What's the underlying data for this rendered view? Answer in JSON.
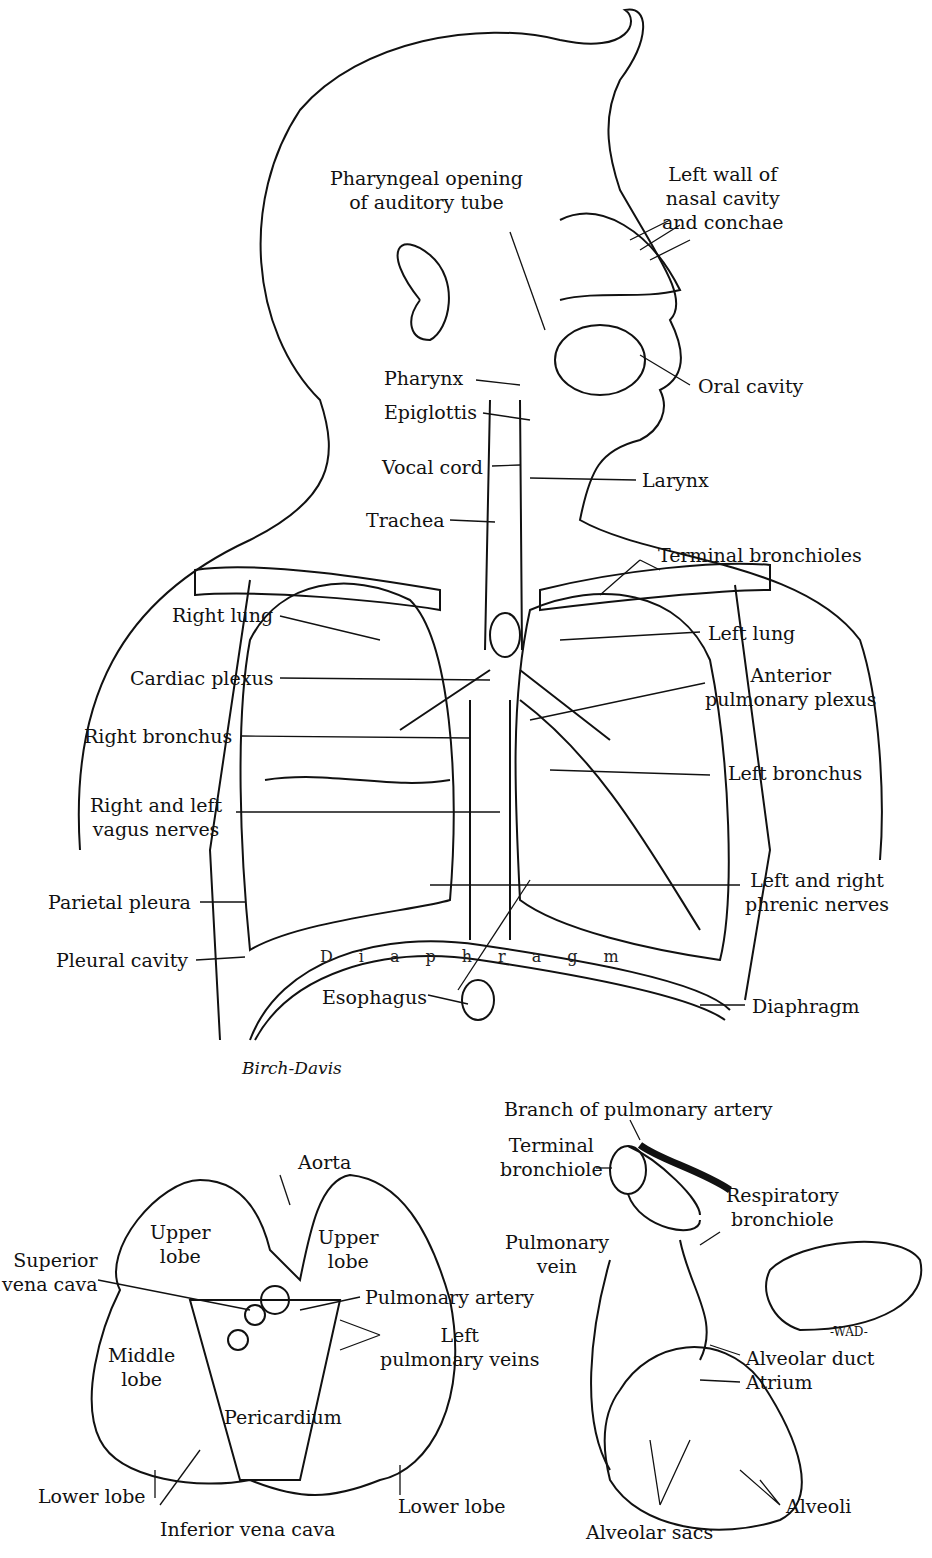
{
  "main_figure": {
    "labels": {
      "pharyngeal_opening": "Pharyngeal opening\nof auditory tube",
      "left_wall_nasal": "Left wall of\nnasal cavity\nand conchae",
      "pharynx": "Pharynx",
      "oral_cavity": "Oral cavity",
      "epiglottis": "Epiglottis",
      "vocal_cord": "Vocal cord",
      "larynx": "Larynx",
      "trachea": "Trachea",
      "terminal_bronchioles": "Terminal bronchioles",
      "right_lung": "Right lung",
      "left_lung": "Left lung",
      "cardiac_plexus": "Cardiac plexus",
      "anterior_pulmonary_plexus": "Anterior\npulmonary plexus",
      "right_bronchus": "Right bronchus",
      "left_bronchus": "Left bronchus",
      "vagus_nerves": "Right and left\nvagus nerves",
      "phrenic_nerves": "Left and right\nphrenic nerves",
      "parietal_pleura": "Parietal pleura",
      "pleural_cavity": "Pleural cavity",
      "esophagus": "Esophagus",
      "diaphragm": "Diaphragm",
      "diaphragm_inscription": "D i a p h r a g m"
    },
    "signature": "Birch-Davis"
  },
  "heart_lungs_figure": {
    "labels": {
      "aorta": "Aorta",
      "upper_lobe_right": "Upper\nlobe",
      "upper_lobe_left": "Upper\nlobe",
      "superior_vena_cava": "Superior\nvena cava",
      "pulmonary_artery": "Pulmonary artery",
      "left_pulmonary_veins": "Left\npulmonary veins",
      "middle_lobe": "Middle\nlobe",
      "pericardium": "Pericardium",
      "lower_lobe_right": "Lower lobe",
      "lower_lobe_left": "Lower lobe",
      "inferior_vena_cava": "Inferior vena cava"
    }
  },
  "alveoli_figure": {
    "labels": {
      "branch_pulmonary_artery": "Branch of pulmonary artery",
      "terminal_bronchiole": "Terminal\nbronchiole",
      "respiratory_bronchiole": "Respiratory\nbronchiole",
      "pulmonary_vein": "Pulmonary\nvein",
      "alveolar_duct": "Alveolar duct",
      "atrium": "Atrium",
      "alveoli": "Alveoli",
      "alveolar_sacs": "Alveolar sacs"
    },
    "signature": "-WAD-"
  }
}
